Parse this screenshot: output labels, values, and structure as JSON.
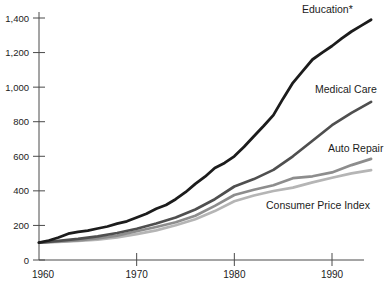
{
  "chart_data": {
    "type": "line",
    "title": "",
    "xlabel": "",
    "ylabel": "",
    "xlim": [
      1960,
      1994
    ],
    "ylim": [
      0,
      1400
    ],
    "grid": false,
    "legend_position": "inline-labels-right",
    "axis_color": "#4a4a4a",
    "y_ticks": [
      {
        "value": 0,
        "label": "0"
      },
      {
        "value": 200,
        "label": "200"
      },
      {
        "value": 400,
        "label": "400"
      },
      {
        "value": 600,
        "label": "600"
      },
      {
        "value": 800,
        "label": "800"
      },
      {
        "value": 1000,
        "label": "1,000"
      },
      {
        "value": 1200,
        "label": "1,200"
      },
      {
        "value": 1400,
        "label": "1,400"
      }
    ],
    "x_ticks": [
      {
        "value": 1960,
        "label": "1960",
        "draw_tick": false,
        "dx": 4
      },
      {
        "value": 1970,
        "label": "1970",
        "draw_tick": true,
        "dx": 0
      },
      {
        "value": 1980,
        "label": "1980",
        "draw_tick": true,
        "dx": 0
      },
      {
        "value": 1990,
        "label": "1990",
        "draw_tick": true,
        "dx": 0
      }
    ],
    "series": [
      {
        "id": "education",
        "name": "Education*",
        "color": "#1c1c1c",
        "stroke_width": 2.8,
        "label": {
          "x": 302,
          "y": 13
        },
        "points": [
          [
            1960,
            100
          ],
          [
            1961,
            113
          ],
          [
            1962,
            130
          ],
          [
            1963,
            152
          ],
          [
            1964,
            163
          ],
          [
            1965,
            170
          ],
          [
            1966,
            182
          ],
          [
            1967,
            194
          ],
          [
            1968,
            210
          ],
          [
            1969,
            224
          ],
          [
            1970,
            246
          ],
          [
            1971,
            268
          ],
          [
            1972,
            296
          ],
          [
            1973,
            318
          ],
          [
            1974,
            352
          ],
          [
            1975,
            392
          ],
          [
            1976,
            440
          ],
          [
            1977,
            482
          ],
          [
            1978,
            532
          ],
          [
            1979,
            562
          ],
          [
            1980,
            600
          ],
          [
            1981,
            655
          ],
          [
            1982,
            716
          ],
          [
            1983,
            775
          ],
          [
            1984,
            838
          ],
          [
            1985,
            935
          ],
          [
            1986,
            1025
          ],
          [
            1987,
            1092
          ],
          [
            1988,
            1160
          ],
          [
            1989,
            1200
          ],
          [
            1990,
            1238
          ],
          [
            1991,
            1282
          ],
          [
            1992,
            1322
          ],
          [
            1993,
            1356
          ],
          [
            1994,
            1390
          ]
        ]
      },
      {
        "id": "medical-care",
        "name": "Medical Care",
        "color": "#4f4f4f",
        "stroke_width": 2.7,
        "label": {
          "x": 315,
          "y": 93
        },
        "points": [
          [
            1960,
            100
          ],
          [
            1962,
            111
          ],
          [
            1964,
            122
          ],
          [
            1966,
            137
          ],
          [
            1968,
            156
          ],
          [
            1970,
            181
          ],
          [
            1972,
            211
          ],
          [
            1974,
            246
          ],
          [
            1976,
            292
          ],
          [
            1978,
            352
          ],
          [
            1980,
            425
          ],
          [
            1982,
            468
          ],
          [
            1984,
            521
          ],
          [
            1986,
            600
          ],
          [
            1988,
            690
          ],
          [
            1990,
            780
          ],
          [
            1992,
            851
          ],
          [
            1994,
            915
          ]
        ]
      },
      {
        "id": "auto-repair",
        "name": "Auto Repair",
        "color": "#8d8d8d",
        "stroke_width": 2.7,
        "label": {
          "x": 328,
          "y": 152
        },
        "points": [
          [
            1960,
            100
          ],
          [
            1962,
            107
          ],
          [
            1964,
            114
          ],
          [
            1966,
            125
          ],
          [
            1968,
            141
          ],
          [
            1970,
            166
          ],
          [
            1972,
            191
          ],
          [
            1974,
            218
          ],
          [
            1976,
            256
          ],
          [
            1978,
            313
          ],
          [
            1980,
            376
          ],
          [
            1982,
            406
          ],
          [
            1984,
            433
          ],
          [
            1986,
            473
          ],
          [
            1988,
            484
          ],
          [
            1990,
            507
          ],
          [
            1992,
            549
          ],
          [
            1994,
            585
          ]
        ]
      },
      {
        "id": "consumer-price-index",
        "name": "Consumer Price Index",
        "color": "#b5b5b5",
        "stroke_width": 2.7,
        "label": {
          "x": 266,
          "y": 209
        },
        "points": [
          [
            1960,
            100
          ],
          [
            1962,
            104
          ],
          [
            1964,
            110
          ],
          [
            1966,
            118
          ],
          [
            1968,
            131
          ],
          [
            1970,
            150
          ],
          [
            1972,
            171
          ],
          [
            1974,
            201
          ],
          [
            1976,
            236
          ],
          [
            1978,
            283
          ],
          [
            1980,
            340
          ],
          [
            1982,
            373
          ],
          [
            1984,
            399
          ],
          [
            1986,
            419
          ],
          [
            1988,
            449
          ],
          [
            1990,
            476
          ],
          [
            1992,
            501
          ],
          [
            1994,
            520
          ]
        ]
      }
    ]
  }
}
